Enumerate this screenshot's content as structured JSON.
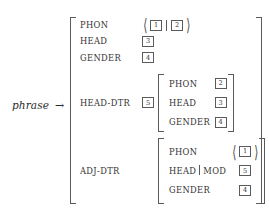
{
  "figure": {
    "kind": "attribute-value-matrix",
    "type_label": "phrase",
    "arrow": "→"
  },
  "outer": {
    "rows": [
      {
        "attribute": "PHON",
        "value_kind": "list",
        "list_tags": [
          "1",
          "2"
        ],
        "separator": "|"
      },
      {
        "attribute": "HEAD",
        "value_kind": "tag",
        "tag": "3"
      },
      {
        "attribute": "GENDER",
        "value_kind": "tag",
        "tag": "4"
      },
      {
        "attribute": "HEAD-DTR",
        "value_kind": "matrix",
        "tag": "5"
      },
      {
        "attribute": "ADJ-DTR",
        "value_kind": "matrix",
        "tag": ""
      }
    ]
  },
  "head_dtr_matrix": {
    "tag": "5",
    "rows": [
      {
        "attribute": "PHON",
        "tag": "2"
      },
      {
        "attribute": "HEAD",
        "tag": "3"
      },
      {
        "attribute": "GENDER",
        "tag": "4"
      }
    ]
  },
  "adj_dtr_matrix": {
    "rows": [
      {
        "attribute": "PHON",
        "value_kind": "list",
        "list_tags": [
          "1"
        ]
      },
      {
        "attribute_path": [
          "HEAD",
          "MOD"
        ],
        "path_separator": "|",
        "value_kind": "tag",
        "tag": "5"
      },
      {
        "attribute": "GENDER",
        "value_kind": "tag",
        "tag": "4"
      }
    ]
  },
  "glyphs": {
    "angle_open": "⟨",
    "angle_close": "⟩"
  },
  "colors": {
    "ink": "#2b2b2b",
    "rule": "#5a5a5a",
    "background": "#ffffff"
  }
}
